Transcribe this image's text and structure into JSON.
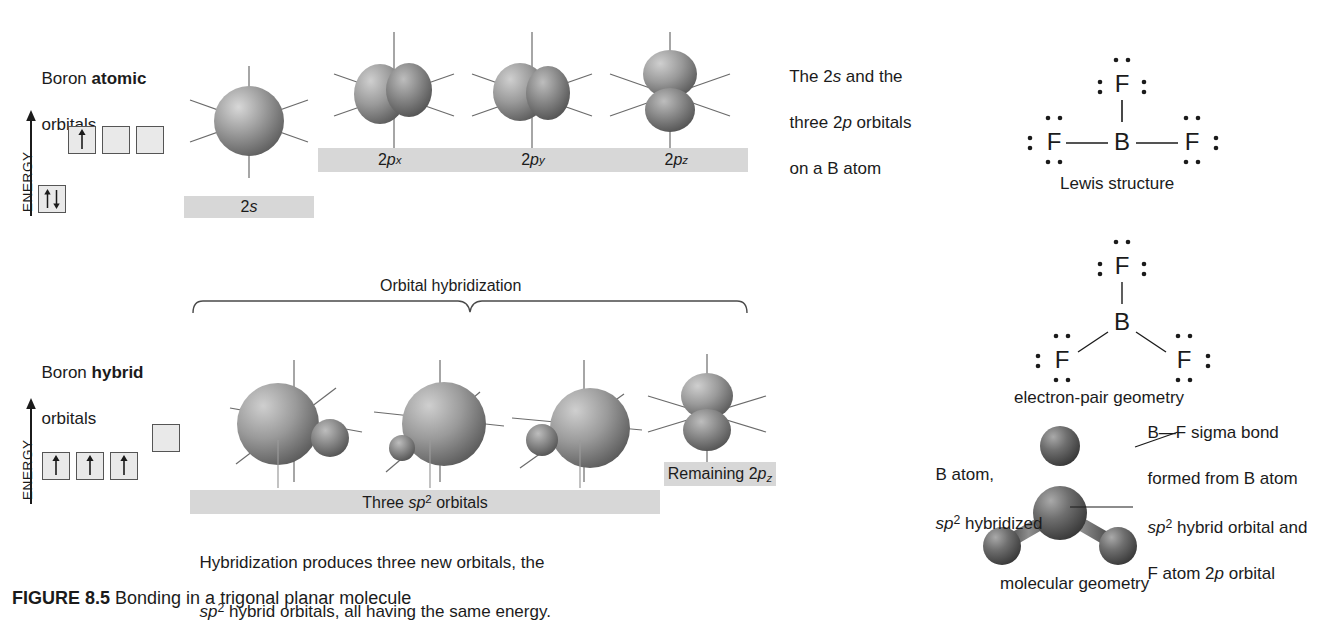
{
  "figure": {
    "caption": "FIGURE 8.5 Bonding in a trigonal planar molecule"
  },
  "atomic_section": {
    "title_plain": "Boron ",
    "title_bold": "atomic",
    "title_line2": "orbitals",
    "energy_axis_label": "ENERGY",
    "p_boxes": [
      "↑",
      "",
      ""
    ],
    "s_box": "↑↓"
  },
  "hybrid_section": {
    "title_plain": "Boron ",
    "title_bold": "hybrid",
    "title_line2": "orbitals",
    "energy_axis_label": "ENERGY",
    "sp2_boxes": [
      "↑",
      "↑",
      "↑"
    ],
    "empty_box": ""
  },
  "orbital_labels": {
    "s_2s": "2s",
    "p_x": "2px",
    "p_y": "2py",
    "p_z": "2pz",
    "three_sp2": "Three sp2 orbitals",
    "remaining_pz": "Remaining 2pz"
  },
  "bracket": {
    "label": "Orbital hybridization"
  },
  "notes": {
    "top_right_line1": "The 2s and the",
    "top_right_line2": "three 2p orbitals",
    "top_right_line3": "on a B atom",
    "bottom_line1": "Hybridization produces three new orbitals, the",
    "bottom_line2": "sp2 hybrid orbitals, all having the same energy."
  },
  "lewis": {
    "center_atom": "B",
    "top_atom": "F",
    "left_atom": "F",
    "right_atom": "F",
    "caption": "Lewis structure"
  },
  "electron_pair": {
    "center_atom": "B",
    "top_atom": "F",
    "left_atom": "F",
    "right_atom": "F",
    "caption": "electron-pair geometry"
  },
  "molecular": {
    "caption": "molecular geometry",
    "left_annotation_line1": "B atom,",
    "left_annotation_line2": "sp2 hybridized",
    "right_annotation_line1": "B—F sigma bond",
    "right_annotation_line2": "formed from B atom",
    "right_annotation_line3": "sp2 hybrid orbital and",
    "right_annotation_line4": "F atom 2p orbital"
  },
  "colors": {
    "label_bar": "#d7d7d7",
    "text": "#1b1b1b",
    "orbital_dark": "#6e6e6e",
    "orbital_light": "#c9c9c9",
    "axis_line": "#555555",
    "atom_sphere": "#5a5a5a"
  }
}
